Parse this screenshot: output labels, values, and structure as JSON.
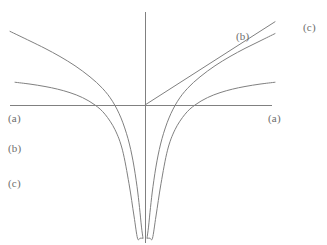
{
  "figure": {
    "background_color": "#ffffff",
    "stroke_color": "#808080",
    "label_color": "#6d6d6d",
    "axes": {
      "x_axis": {
        "name": "horizontal-axis",
        "x1": 10,
        "y1": 105,
        "x2": 272,
        "y2": 105
      },
      "y_axis": {
        "name": "vertical-axis",
        "x1": 145,
        "y1": 12,
        "x2": 145,
        "y2": 243
      }
    },
    "labels": [
      {
        "id": "label-a-left",
        "text": "(a)",
        "x": 8,
        "y": 113
      },
      {
        "id": "label-a-right",
        "text": "(a)",
        "x": 268,
        "y": 113
      },
      {
        "id": "label-b-left",
        "text": "(b)",
        "x": 8,
        "y": 143
      },
      {
        "id": "label-b-right",
        "text": "(b)",
        "x": 236,
        "y": 31
      },
      {
        "id": "label-c-left",
        "text": "(c)",
        "x": 8,
        "y": 178
      },
      {
        "id": "label-c-right",
        "text": "(c)",
        "x": 303,
        "y": 22
      }
    ]
  },
  "chart_data": {
    "type": "line",
    "title": "",
    "subtitle": "",
    "xlabel": "",
    "ylabel": "",
    "grid": false,
    "legend_position": "inline-curve-labels",
    "axis_style": "centered-cross",
    "origin_px": {
      "x": 145,
      "y": 105
    },
    "xlim": [
      -2.7,
      2.6
    ],
    "ylim": [
      -3.6,
      1.45
    ],
    "px_per_unit_x": 50,
    "px_per_unit_y": 37,
    "series": [
      {
        "name": "(a)",
        "label": "(a)",
        "color": "#808080",
        "form": "1 - |x|^(-1)  (approaches horizontal asymptote y = 1)",
        "asymptote": {
          "type": "vertical",
          "x": 0
        },
        "horizontal_asymptote": 1.0,
        "x": [
          -2.6,
          -2.3,
          -2.0,
          -1.75,
          -1.5,
          -1.25,
          -1.0,
          -0.8,
          -0.6,
          -0.45,
          -0.32,
          -0.22,
          -0.15,
          -0.1,
          -0.07,
          -0.05,
          0.05,
          0.07,
          0.1,
          0.15,
          0.22,
          0.32,
          0.45,
          0.6,
          0.8,
          1.0,
          1.25,
          1.5,
          1.75,
          2.0,
          2.3,
          2.6
        ],
        "y": [
          0.615,
          0.565,
          0.5,
          0.429,
          0.333,
          0.2,
          0.0,
          -0.25,
          -0.667,
          -1.222,
          -2.125,
          -3.0,
          -3.6,
          -3.6,
          -3.6,
          -3.6,
          -3.6,
          -3.6,
          -3.6,
          -3.6,
          -3.0,
          -2.125,
          -1.222,
          -0.667,
          -0.25,
          0.0,
          0.2,
          0.333,
          0.429,
          0.5,
          0.565,
          0.615
        ]
      },
      {
        "name": "(b)",
        "label": "(b)",
        "color": "#808080",
        "form": "straight rays through the origin, slope +/- 0.53 in plot units",
        "asymptote": {
          "type": "none",
          "x": 0
        },
        "x": [
          -2.7,
          0.0,
          2.6
        ],
        "y": [
          -2.25,
          0.0,
          2.25
        ]
      },
      {
        "name": "(c)",
        "label": "(c)",
        "color": "#808080",
        "form": "log-like: ln|x| scaled (between (a) and (b))",
        "asymptote": {
          "type": "vertical",
          "x": 0
        },
        "x": [
          -2.7,
          -2.3,
          -2.0,
          -1.7,
          -1.4,
          -1.1,
          -0.85,
          -0.65,
          -0.48,
          -0.34,
          -0.24,
          -0.16,
          -0.11,
          -0.07,
          -0.04,
          0.04,
          0.07,
          0.11,
          0.16,
          0.24,
          0.34,
          0.48,
          0.65,
          0.85,
          1.1,
          1.4,
          1.7,
          2.0,
          2.3,
          2.6
        ],
        "y": [
          1.99,
          1.73,
          1.53,
          1.31,
          1.06,
          0.76,
          0.45,
          0.1,
          -0.35,
          -0.91,
          -1.51,
          -2.2,
          -2.77,
          -3.3,
          -3.6,
          -3.6,
          -3.3,
          -2.77,
          -2.2,
          -1.51,
          -0.91,
          -0.35,
          0.1,
          0.45,
          0.76,
          1.06,
          1.31,
          1.53,
          1.73,
          1.93
        ]
      }
    ]
  }
}
